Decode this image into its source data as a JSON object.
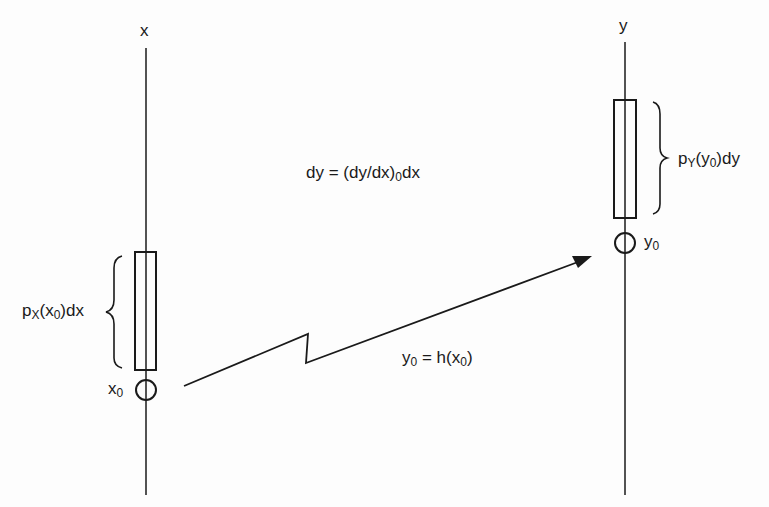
{
  "axes": {
    "x_label": "x",
    "y_label": "y"
  },
  "labels": {
    "px_prefix": "p",
    "px_sub": "X",
    "px_mid": "(x",
    "px_sub2": "0",
    "px_suffix": ")dx",
    "py_prefix": "p",
    "py_sub": "Y",
    "py_mid": "(y",
    "py_sub2": "0",
    "py_suffix": ")dy",
    "x0_base": "x",
    "x0_sub": "0",
    "y0_base": "y",
    "y0_sub": "0",
    "eq_dy_left": "dy = (dy/dx)",
    "eq_dy_sub": "0",
    "eq_dy_right": "dx",
    "eq_map_base": "y",
    "eq_map_sub": "0",
    "eq_map_mid": " = h(x",
    "eq_map_sub2": "0",
    "eq_map_end": ")"
  },
  "colors": {
    "ink": "#1a1a1a",
    "background": "#fdfdfd"
  }
}
